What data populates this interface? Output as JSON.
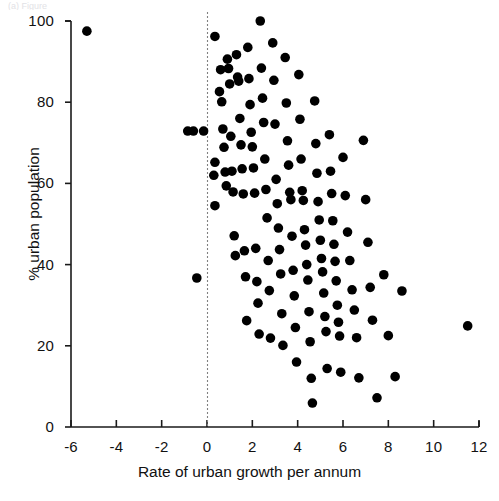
{
  "figure": {
    "top_artifact_text": "(a) Figure",
    "background_color": "#ffffff",
    "marker_color": "#000000",
    "axis_color": "#1a1a1a",
    "reference_line_color": "#808080"
  },
  "axes": {
    "xlabel": "Rate of urban growth per annum",
    "ylabel": "% urban population",
    "x_ticks": [
      "-6",
      "-4",
      "-2",
      "0",
      "2",
      "4",
      "6",
      "8",
      "10",
      "12"
    ],
    "y_ticks": [
      "0",
      "20",
      "40",
      "60",
      "80",
      "100"
    ]
  },
  "chart_data": {
    "type": "scatter",
    "title": "",
    "xlabel": "Rate of urban growth per annum",
    "ylabel": "% urban population",
    "xlim": [
      -6,
      12
    ],
    "ylim": [
      0,
      100
    ],
    "xticks": [
      -6,
      -4,
      -2,
      0,
      2,
      4,
      6,
      8,
      10,
      12
    ],
    "yticks": [
      0,
      20,
      40,
      60,
      80,
      100
    ],
    "grid": false,
    "legend": null,
    "annotations": [
      {
        "type": "vline",
        "x": 0,
        "style": "dashed",
        "color": "#808080"
      }
    ],
    "marker": {
      "shape": "circle",
      "color": "#000000",
      "size": 5
    },
    "points": [
      [
        -5.3,
        97.5
      ],
      [
        -0.85,
        72.9
      ],
      [
        -0.6,
        72.9
      ],
      [
        -0.15,
        72.9
      ],
      [
        -0.45,
        36.7
      ],
      [
        0.35,
        96.2
      ],
      [
        0.35,
        65.2
      ],
      [
        0.3,
        62.0
      ],
      [
        0.35,
        54.5
      ],
      [
        0.55,
        82.6
      ],
      [
        0.6,
        88.0
      ],
      [
        0.65,
        80.1
      ],
      [
        0.7,
        73.4
      ],
      [
        0.75,
        68.9
      ],
      [
        0.8,
        62.8
      ],
      [
        0.85,
        59.4
      ],
      [
        0.9,
        90.6
      ],
      [
        0.95,
        88.3
      ],
      [
        1.0,
        84.5
      ],
      [
        1.05,
        71.6
      ],
      [
        1.1,
        63.0
      ],
      [
        1.15,
        57.9
      ],
      [
        1.2,
        47.1
      ],
      [
        1.25,
        42.2
      ],
      [
        1.3,
        91.7
      ],
      [
        1.35,
        86.2
      ],
      [
        1.4,
        85.2
      ],
      [
        1.45,
        76.0
      ],
      [
        1.5,
        69.5
      ],
      [
        1.55,
        63.6
      ],
      [
        1.6,
        57.4
      ],
      [
        1.65,
        43.4
      ],
      [
        1.7,
        37.0
      ],
      [
        1.75,
        26.2
      ],
      [
        1.8,
        93.5
      ],
      [
        1.85,
        85.8
      ],
      [
        1.9,
        79.4
      ],
      [
        1.95,
        72.6
      ],
      [
        2.0,
        69.0
      ],
      [
        2.05,
        63.8
      ],
      [
        2.1,
        57.6
      ],
      [
        2.15,
        44.0
      ],
      [
        2.2,
        35.8
      ],
      [
        2.25,
        30.5
      ],
      [
        2.3,
        22.9
      ],
      [
        2.35,
        100.0
      ],
      [
        2.4,
        88.4
      ],
      [
        2.45,
        81.0
      ],
      [
        2.5,
        75.0
      ],
      [
        2.55,
        66.0
      ],
      [
        2.6,
        58.5
      ],
      [
        2.65,
        51.5
      ],
      [
        2.7,
        41.0
      ],
      [
        2.75,
        33.6
      ],
      [
        2.8,
        21.9
      ],
      [
        2.9,
        94.6
      ],
      [
        2.95,
        85.4
      ],
      [
        3.0,
        74.6
      ],
      [
        3.05,
        61.0
      ],
      [
        3.1,
        55.0
      ],
      [
        3.15,
        49.0
      ],
      [
        3.2,
        43.7
      ],
      [
        3.25,
        37.7
      ],
      [
        3.3,
        27.9
      ],
      [
        3.35,
        20.1
      ],
      [
        3.45,
        91.0
      ],
      [
        3.5,
        79.8
      ],
      [
        3.55,
        70.5
      ],
      [
        3.6,
        64.5
      ],
      [
        3.65,
        57.8
      ],
      [
        3.7,
        56.0
      ],
      [
        3.75,
        47.0
      ],
      [
        3.8,
        38.6
      ],
      [
        3.85,
        32.3
      ],
      [
        3.9,
        24.5
      ],
      [
        3.95,
        16.0
      ],
      [
        4.05,
        86.8
      ],
      [
        4.1,
        75.8
      ],
      [
        4.15,
        66.0
      ],
      [
        4.2,
        58.2
      ],
      [
        4.25,
        55.8
      ],
      [
        4.3,
        48.6
      ],
      [
        4.35,
        44.8
      ],
      [
        4.4,
        40.0
      ],
      [
        4.45,
        36.2
      ],
      [
        4.5,
        28.4
      ],
      [
        4.55,
        21.0
      ],
      [
        4.6,
        12.0
      ],
      [
        4.65,
        5.9
      ],
      [
        4.75,
        80.3
      ],
      [
        4.8,
        69.8
      ],
      [
        4.85,
        62.5
      ],
      [
        4.9,
        55.5
      ],
      [
        4.95,
        51.0
      ],
      [
        5.0,
        46.0
      ],
      [
        5.05,
        41.5
      ],
      [
        5.1,
        38.2
      ],
      [
        5.15,
        33.0
      ],
      [
        5.2,
        27.2
      ],
      [
        5.25,
        23.5
      ],
      [
        5.3,
        14.4
      ],
      [
        5.4,
        72.0
      ],
      [
        5.45,
        63.0
      ],
      [
        5.5,
        57.5
      ],
      [
        5.55,
        50.8
      ],
      [
        5.6,
        45.0
      ],
      [
        5.65,
        40.8
      ],
      [
        5.7,
        36.0
      ],
      [
        5.75,
        30.0
      ],
      [
        5.8,
        25.8
      ],
      [
        5.85,
        22.4
      ],
      [
        5.9,
        13.5
      ],
      [
        6.0,
        66.4
      ],
      [
        6.1,
        57.0
      ],
      [
        6.2,
        48.0
      ],
      [
        6.3,
        41.0
      ],
      [
        6.4,
        33.8
      ],
      [
        6.5,
        28.8
      ],
      [
        6.6,
        22.0
      ],
      [
        6.7,
        12.1
      ],
      [
        6.9,
        70.6
      ],
      [
        7.0,
        56.0
      ],
      [
        7.1,
        45.5
      ],
      [
        7.2,
        34.4
      ],
      [
        7.3,
        26.3
      ],
      [
        7.5,
        7.2
      ],
      [
        7.8,
        37.5
      ],
      [
        8.0,
        22.5
      ],
      [
        8.3,
        12.4
      ],
      [
        8.6,
        33.5
      ],
      [
        11.5,
        24.9
      ]
    ]
  }
}
